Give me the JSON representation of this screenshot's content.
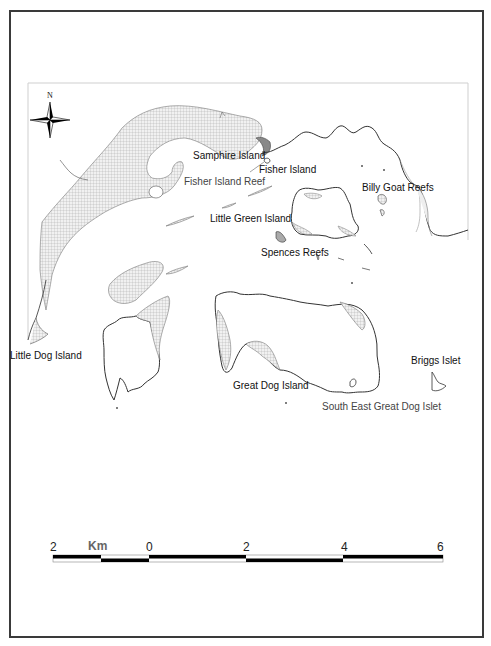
{
  "map": {
    "north_label": "N",
    "labels": {
      "samphire_island": "Samphire Island",
      "fisher_island": "Fisher Island",
      "fisher_island_reef": "Fisher Island Reef",
      "billy_goat_reefs": "Billy Goat Reefs",
      "little_green_island": "Little Green Island",
      "spences_reefs": "Spences Reefs",
      "little_dog_island": "Little Dog Island",
      "great_dog_island": "Great Dog Island",
      "briggs_islet": "Briggs Islet",
      "south_east_great_dog_islet": "South East Great Dog Islet"
    }
  },
  "scale_bar": {
    "unit": "Km",
    "ticks": [
      "2",
      "0",
      "2",
      "4",
      "6"
    ]
  },
  "colors": {
    "frame": "#3a3a3a",
    "coastline": "#333333",
    "tidal_flat_fill": "#e6e6e6",
    "hatch": "#9a9a9a",
    "scale_bar": "#000000"
  }
}
